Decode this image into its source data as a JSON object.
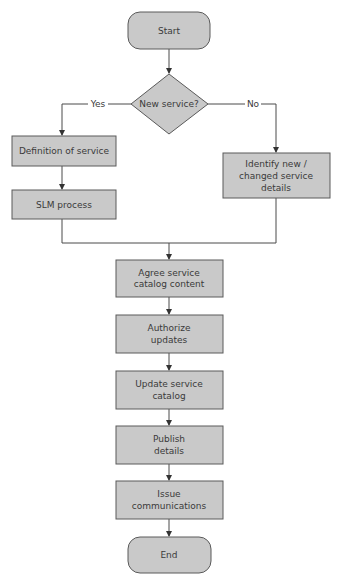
{
  "diagram": {
    "type": "flowchart",
    "nodes": {
      "start": {
        "label": [
          "Start"
        ],
        "shape": "terminal"
      },
      "decision": {
        "label": [
          "New service?"
        ],
        "shape": "decision"
      },
      "definition": {
        "label": [
          "Definition of service"
        ],
        "shape": "process"
      },
      "slm": {
        "label": [
          "SLM process"
        ],
        "shape": "process"
      },
      "identify": {
        "label": [
          "Identify new /",
          "changed service",
          "details"
        ],
        "shape": "process"
      },
      "agree": {
        "label": [
          "Agree service",
          "catalog content"
        ],
        "shape": "process"
      },
      "authorize": {
        "label": [
          "Authorize",
          "updates"
        ],
        "shape": "process"
      },
      "update": {
        "label": [
          "Update service",
          "catalog"
        ],
        "shape": "process"
      },
      "publish": {
        "label": [
          "Publish",
          "details"
        ],
        "shape": "process"
      },
      "issue": {
        "label": [
          "Issue",
          "communications"
        ],
        "shape": "process"
      },
      "end": {
        "label": [
          "End"
        ],
        "shape": "terminal"
      }
    },
    "edges": [
      {
        "from": "start",
        "to": "decision",
        "label": ""
      },
      {
        "from": "decision",
        "to": "definition",
        "label": "Yes"
      },
      {
        "from": "decision",
        "to": "identify",
        "label": "No"
      },
      {
        "from": "definition",
        "to": "slm",
        "label": ""
      },
      {
        "from": "slm",
        "to": "agree",
        "label": ""
      },
      {
        "from": "identify",
        "to": "agree",
        "label": ""
      },
      {
        "from": "agree",
        "to": "authorize",
        "label": ""
      },
      {
        "from": "authorize",
        "to": "update",
        "label": ""
      },
      {
        "from": "update",
        "to": "publish",
        "label": ""
      },
      {
        "from": "publish",
        "to": "issue",
        "label": ""
      },
      {
        "from": "issue",
        "to": "end",
        "label": ""
      }
    ],
    "branch_labels": {
      "yes": "Yes",
      "no": "No"
    }
  }
}
